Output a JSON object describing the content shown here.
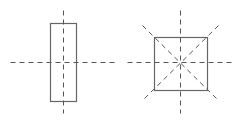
{
  "diagram": {
    "colors": {
      "stroke": "#666666",
      "axis": "#555555",
      "background": "#ffffff"
    },
    "shapes": [
      {
        "name": "rectangle",
        "axes_count": 2,
        "rect": {
          "x": 50,
          "y": 23,
          "w": 26,
          "h": 78
        },
        "axes": [
          {
            "x1": 63,
            "y1": 10,
            "x2": 63,
            "y2": 113
          },
          {
            "x1": 10,
            "y1": 62,
            "x2": 115,
            "y2": 62
          }
        ]
      },
      {
        "name": "square",
        "axes_count": 4,
        "rect": {
          "x": 154,
          "y": 37,
          "w": 53,
          "h": 53
        },
        "axes": [
          {
            "x1": 180,
            "y1": 10,
            "x2": 180,
            "y2": 113
          },
          {
            "x1": 127,
            "y1": 62,
            "x2": 233,
            "y2": 62
          },
          {
            "x1": 142,
            "y1": 25,
            "x2": 218,
            "y2": 100
          },
          {
            "x1": 218,
            "y1": 25,
            "x2": 142,
            "y2": 100
          }
        ]
      }
    ]
  }
}
